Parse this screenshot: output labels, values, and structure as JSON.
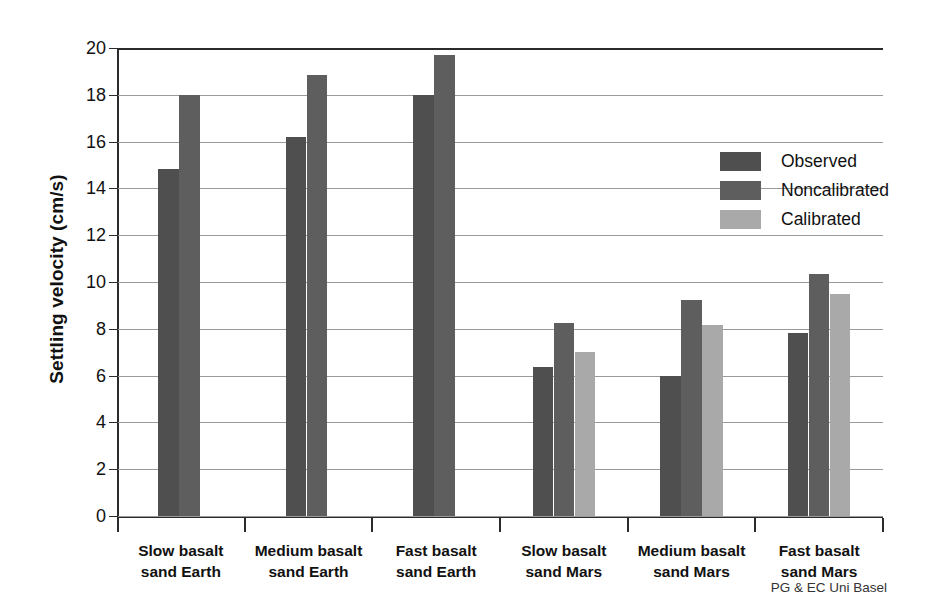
{
  "chart_data": {
    "type": "bar",
    "title": "",
    "subtitle": "",
    "xlabel": "",
    "ylabel": "Settling velocity (cm/s)",
    "ylim": [
      0,
      20
    ],
    "ytick_step": 2,
    "yticks": [
      "0",
      "2",
      "4",
      "6",
      "8",
      "10",
      "12",
      "14",
      "16",
      "18",
      "20"
    ],
    "grid": true,
    "legend_position": "upper-right-inside",
    "categories": [
      "Slow basalt\nsand Earth",
      "Medium basalt\nsand Earth",
      "Fast basalt\nsand Earth",
      "Slow basalt\nsand Mars",
      "Medium basalt\nsand Mars",
      "Fast basalt\nsand Mars"
    ],
    "category_lines": [
      [
        "Slow basalt",
        "sand Earth"
      ],
      [
        "Medium basalt",
        "sand Earth"
      ],
      [
        "Fast basalt",
        "sand Earth"
      ],
      [
        "Slow basalt",
        "sand Mars"
      ],
      [
        "Medium basalt",
        "sand Mars"
      ],
      [
        "Fast basalt",
        "sand Mars"
      ]
    ],
    "series": [
      {
        "name": "Observed",
        "color": "#4f4f4f",
        "values": [
          14.85,
          16.2,
          18.0,
          6.35,
          6.0,
          7.8
        ]
      },
      {
        "name": "Noncalibrated",
        "color": "#5e5e5e",
        "values": [
          18.0,
          18.85,
          19.7,
          8.25,
          9.25,
          10.35
        ]
      },
      {
        "name": "Calibrated",
        "color": "#a9a9a9",
        "values": [
          null,
          null,
          null,
          7.0,
          8.15,
          9.5
        ]
      }
    ]
  },
  "legend": {
    "items": [
      {
        "label": "Observed",
        "color": "#4f4f4f"
      },
      {
        "label": "Noncalibrated",
        "color": "#5e5e5e"
      },
      {
        "label": "Calibrated",
        "color": "#a9a9a9"
      }
    ]
  },
  "credit": "PG & EC Uni Basel",
  "colors": {
    "observed": "#4f4f4f",
    "noncalibrated": "#5e5e5e",
    "calibrated": "#a9a9a9",
    "axis": "#2b2b2b",
    "grid": "#9a9a9a",
    "background": "#ffffff"
  }
}
